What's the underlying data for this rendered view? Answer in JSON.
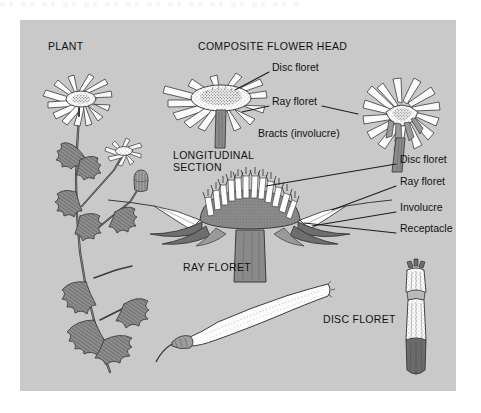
{
  "figure": {
    "background_color": "#ffffff",
    "panel_color": "#c9c9c9",
    "ink_color": "#3a3a3a",
    "text_color": "#111111"
  },
  "headings": [
    {
      "id": "plant",
      "label": "PLANT",
      "x": 48,
      "y": 47
    },
    {
      "id": "composite-flower-head",
      "label": "COMPOSITE FLOWER HEAD",
      "x": 198,
      "y": 47
    },
    {
      "id": "longitudinal-section-line1",
      "label": "LONGITUDINAL",
      "x": 173,
      "y": 156
    },
    {
      "id": "longitudinal-section-line2",
      "label": "SECTION",
      "x": 173,
      "y": 168
    },
    {
      "id": "ray-floret",
      "label": "RAY FLORET",
      "x": 183,
      "y": 268
    },
    {
      "id": "disc-floret",
      "label": "DISC FLORET",
      "x": 323,
      "y": 320
    }
  ],
  "callouts": [
    {
      "id": "head-disc-floret",
      "label": "Disc floret",
      "x": 272,
      "y": 68
    },
    {
      "id": "head-ray-floret",
      "label": "Ray floret",
      "x": 272,
      "y": 102
    },
    {
      "id": "head-bracts",
      "label": "Bracts (involucre)",
      "x": 258,
      "y": 134
    },
    {
      "id": "section-disc-floret",
      "label": "Disc floret",
      "x": 400,
      "y": 160
    },
    {
      "id": "section-ray-floret",
      "label": "Ray floret",
      "x": 400,
      "y": 182
    },
    {
      "id": "section-involucre",
      "label": "Involucre",
      "x": 400,
      "y": 208
    },
    {
      "id": "section-receptacle",
      "label": "Receptacle",
      "x": 400,
      "y": 229
    }
  ],
  "illustrations": [
    {
      "id": "plant-whole",
      "name": "whole plant with flower heads, bud and lobed leaves"
    },
    {
      "id": "flower-head-side",
      "name": "composite flower head side view"
    },
    {
      "id": "flower-head-oblique",
      "name": "composite flower head oblique view"
    },
    {
      "id": "longitudinal-section",
      "name": "longitudinal section of flower head"
    },
    {
      "id": "ray-floret-detail",
      "name": "isolated ray floret"
    },
    {
      "id": "disc-floret-detail",
      "name": "isolated disc floret"
    }
  ]
}
